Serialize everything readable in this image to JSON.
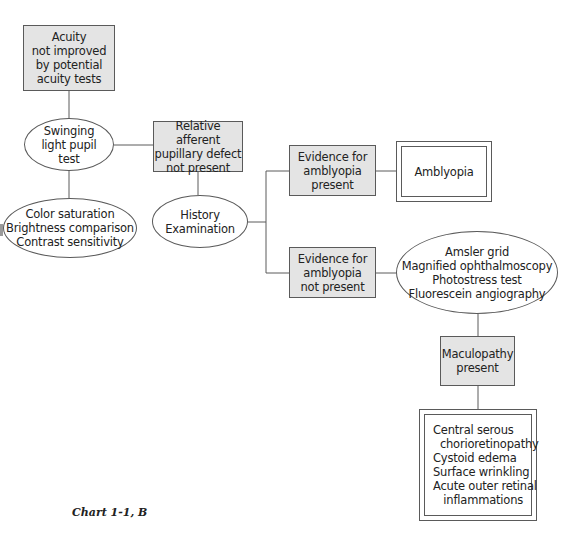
{
  "diagram": {
    "type": "flowchart",
    "caption": "Chart 1-1, B",
    "nodes": {
      "acuity": {
        "shape": "box",
        "lines": [
          "Acuity",
          "not improved",
          "by potential",
          "acuity tests"
        ]
      },
      "swinging": {
        "shape": "ellipse",
        "lines": [
          "Swinging",
          "light pupil",
          "test"
        ]
      },
      "color": {
        "shape": "ellipse",
        "lines": [
          "Color saturation",
          "Brightness comparison",
          "Contrast sensitivity"
        ]
      },
      "rapd": {
        "shape": "box",
        "lines": [
          "Relative afferent",
          "pupillary defect",
          "not present"
        ]
      },
      "history": {
        "shape": "ellipse",
        "lines": [
          "History",
          "Examination"
        ]
      },
      "evidence_present": {
        "shape": "box",
        "lines": [
          "Evidence for",
          "amblyopia",
          "present"
        ]
      },
      "amblyopia": {
        "shape": "double-box",
        "lines": [
          "Amblyopia"
        ]
      },
      "evidence_not_present": {
        "shape": "box",
        "lines": [
          "Evidence for",
          "amblyopia",
          "not present"
        ]
      },
      "tests": {
        "shape": "ellipse",
        "lines": [
          "Amsler grid",
          "Magnified ophthalmoscopy",
          "Photostress test",
          "Fluorescein angiography"
        ]
      },
      "maculopathy": {
        "shape": "box",
        "lines": [
          "Maculopathy",
          "present"
        ]
      },
      "conditions": {
        "shape": "double-box",
        "lines": [
          "Central serous",
          "  chorioretinopathy",
          "Cystoid edema",
          "Surface wrinkling",
          "Acute outer retinal",
          "   inflammations"
        ]
      }
    },
    "edges": [
      [
        "acuity",
        "swinging"
      ],
      [
        "swinging",
        "color"
      ],
      [
        "swinging",
        "rapd"
      ],
      [
        "rapd",
        "history"
      ],
      [
        "history",
        "evidence_present"
      ],
      [
        "history",
        "evidence_not_present"
      ],
      [
        "evidence_present",
        "amblyopia"
      ],
      [
        "evidence_not_present",
        "tests"
      ],
      [
        "tests",
        "maculopathy"
      ],
      [
        "maculopathy",
        "conditions"
      ]
    ]
  },
  "colors": {
    "box_fill": "#e4e4e4",
    "stroke": "#5a5a5a",
    "background": "#ffffff"
  }
}
